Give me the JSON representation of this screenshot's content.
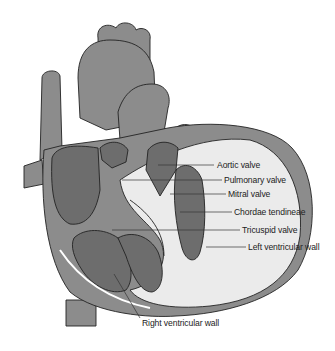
{
  "diagram": {
    "labels": [
      {
        "id": "aortic-valve",
        "text": "Aortic valve"
      },
      {
        "id": "pulmonary-valve",
        "text": "Pulmonary valve"
      },
      {
        "id": "mitral-valve",
        "text": "Mitral valve"
      },
      {
        "id": "chordae-tendineae",
        "text": "Chordae tendineae"
      },
      {
        "id": "tricuspid-valve",
        "text": "Tricuspid valve"
      },
      {
        "id": "left-ventricular-wall",
        "text": "Left ventricular wall"
      },
      {
        "id": "right-ventricular-wall",
        "text": "Right ventricular wall"
      }
    ]
  }
}
